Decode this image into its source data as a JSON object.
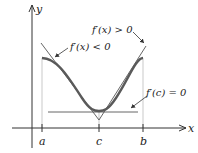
{
  "diagram": {
    "axes": {
      "x_label": "x",
      "y_label": "y"
    },
    "ticks": [
      {
        "label": "a",
        "x": 42
      },
      {
        "label": "c",
        "x": 99
      },
      {
        "label": "b",
        "x": 143
      }
    ],
    "annotations": {
      "left_tangent": "f′(x) < 0",
      "right_tangent": "f′(x) > 0",
      "horizontal_tangent": "f′(c) = 0"
    },
    "colors": {
      "curve": "#5a5a5a",
      "axes": "#333333",
      "tangent": "#555555",
      "guides": "#bbbbbb"
    }
  }
}
